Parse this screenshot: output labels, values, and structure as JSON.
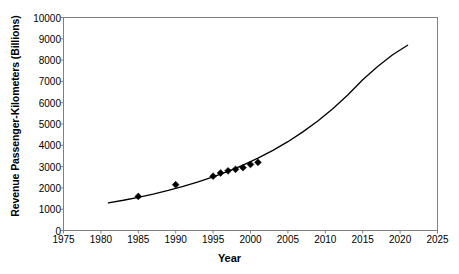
{
  "chart_data": {
    "type": "scatter",
    "title": "",
    "xlabel": "Year",
    "ylabel": "Revenue Passenger-Kilometers (Billions)",
    "xlim": [
      1975,
      2025
    ],
    "ylim": [
      0,
      10000
    ],
    "xticks": [
      1975,
      1980,
      1985,
      1990,
      1995,
      2000,
      2005,
      2010,
      2015,
      2020,
      2025
    ],
    "yticks": [
      0,
      1000,
      2000,
      3000,
      4000,
      5000,
      6000,
      7000,
      8000,
      9000,
      10000
    ],
    "grid": false,
    "legend": null,
    "series": [
      {
        "name": "Observed revenue passenger-kilometers",
        "type": "scatter",
        "marker": "diamond",
        "color": "#000000",
        "points": [
          {
            "x": 1985,
            "y": 1600
          },
          {
            "x": 1990,
            "y": 2150
          },
          {
            "x": 1995,
            "y": 2550
          },
          {
            "x": 1996,
            "y": 2700
          },
          {
            "x": 1997,
            "y": 2800
          },
          {
            "x": 1998,
            "y": 2870
          },
          {
            "x": 1999,
            "y": 2950
          },
          {
            "x": 2000,
            "y": 3100
          },
          {
            "x": 2001,
            "y": 3200
          }
        ]
      },
      {
        "name": "Exponential trend",
        "type": "line",
        "color": "#000000",
        "points": [
          {
            "x": 1981,
            "y": 1300
          },
          {
            "x": 1983,
            "y": 1420
          },
          {
            "x": 1985,
            "y": 1560
          },
          {
            "x": 1987,
            "y": 1710
          },
          {
            "x": 1989,
            "y": 1880
          },
          {
            "x": 1991,
            "y": 2070
          },
          {
            "x": 1993,
            "y": 2280
          },
          {
            "x": 1995,
            "y": 2520
          },
          {
            "x": 1997,
            "y": 2780
          },
          {
            "x": 1999,
            "y": 3070
          },
          {
            "x": 2001,
            "y": 3400
          },
          {
            "x": 2003,
            "y": 3760
          },
          {
            "x": 2005,
            "y": 4170
          },
          {
            "x": 2007,
            "y": 4630
          },
          {
            "x": 2009,
            "y": 5140
          },
          {
            "x": 2011,
            "y": 5720
          },
          {
            "x": 2013,
            "y": 6360
          },
          {
            "x": 2015,
            "y": 7080
          },
          {
            "x": 2017,
            "y": 7700
          },
          {
            "x": 2019,
            "y": 8250
          },
          {
            "x": 2021,
            "y": 8700
          }
        ]
      }
    ]
  },
  "axis": {
    "ytick_labels": [
      "10000",
      "9000",
      "8000",
      "7000",
      "6000",
      "5000",
      "4000",
      "3000",
      "2000",
      "1000",
      "0"
    ],
    "xtick_labels": [
      "1975",
      "1980",
      "1985",
      "1990",
      "1995",
      "2000",
      "2005",
      "2010",
      "2015",
      "2020",
      "2025"
    ]
  },
  "colors": {
    "frame": "#808080",
    "data": "#000000",
    "background": "#ffffff"
  }
}
